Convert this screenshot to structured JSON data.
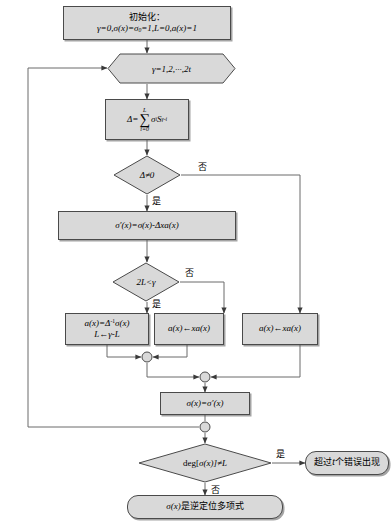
{
  "diagram": {
    "fill_color": "#d9d9d9",
    "stroke_color": "#4a4a4a",
    "background": "#ffffff"
  },
  "nodes": {
    "init": {
      "type": "process",
      "line1": "初始化：",
      "line2_prefix": "γ=0,σ(x)=σ",
      "line2_sub": "0",
      "line2_suffix": "=1,L=0,a(x)=1"
    },
    "loop": {
      "type": "preparation",
      "label": "γ=1,2,···,2t"
    },
    "delta": {
      "type": "process",
      "lhs": "Δ=",
      "sum_upper": "L",
      "sum_symbol": "∑",
      "sum_lower": "i=0",
      "term_sigma": "σ",
      "term_sigma_sub": "i",
      "term_s": "S",
      "term_s_sub": "γ-i"
    },
    "delta_test": {
      "type": "decision",
      "label": "Δ≠0",
      "yes_label": "是",
      "no_label": "否"
    },
    "sigma_prime": {
      "type": "process",
      "label": "σ′(x)=σ(x)-Δxa(x)"
    },
    "two_l_test": {
      "type": "decision",
      "label": "2L<γ",
      "yes_label": "是",
      "no_label": "否"
    },
    "update_a_l": {
      "type": "process",
      "line1_a": "a(x)=Δ",
      "line1_sup": "-1",
      "line1_b": "σ(x)",
      "line2": "L←γ-L"
    },
    "shift_a_mid": {
      "type": "process",
      "label": "a(x)←xa(x)"
    },
    "shift_a_right": {
      "type": "process",
      "label": "a(x)←xa(x)"
    },
    "assign_sigma": {
      "type": "process",
      "label": "σ(x)=σ′(x)"
    },
    "deg_test": {
      "type": "decision",
      "label_prefix": "deg[",
      "label_mid": "σ(x)",
      "label_suffix": "]≠L",
      "yes_label": "是",
      "no_label": "否"
    },
    "too_many_errors": {
      "type": "terminator",
      "label_a": "超过",
      "label_t": "t",
      "label_b": "个错误出现"
    },
    "success": {
      "type": "terminator",
      "label_a": "σ(x)",
      "label_b": "是逆定位多项式"
    }
  },
  "junctions": [
    {
      "name": "merge-left",
      "x": 147,
      "y": 357
    },
    {
      "name": "merge-center",
      "x": 205,
      "y": 377
    },
    {
      "name": "merge-loop-back",
      "x": 205,
      "y": 427
    }
  ],
  "edge_labels": [
    {
      "name": "delta-no",
      "text": "否"
    },
    {
      "name": "delta-yes",
      "text": "是"
    },
    {
      "name": "twol-no",
      "text": "否"
    },
    {
      "name": "twol-yes",
      "text": "是"
    },
    {
      "name": "deg-yes",
      "text": "是"
    },
    {
      "name": "deg-no",
      "text": "否"
    }
  ]
}
